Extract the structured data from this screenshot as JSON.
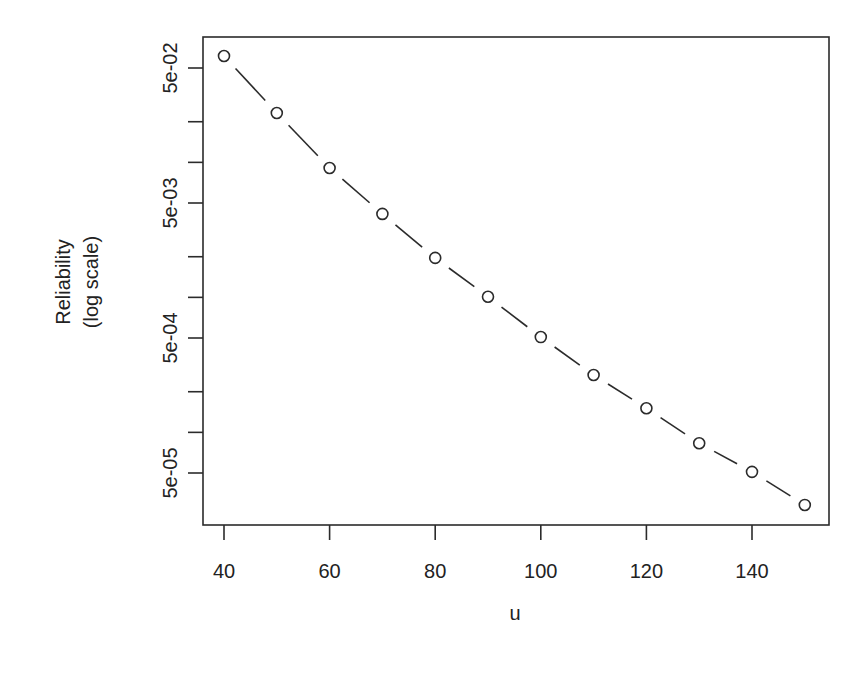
{
  "chart_data": {
    "type": "line",
    "title": "",
    "xlabel": "u",
    "ylabel": "Reliability",
    "ylabel_sub": "(log scale)",
    "yscale": "log",
    "xlim": [
      36,
      154
    ],
    "ylim": [
      2.2e-05,
      0.075
    ],
    "grid": false,
    "legend": null,
    "x_ticks": [
      40,
      60,
      80,
      100,
      120,
      140
    ],
    "x_tick_labels": [
      "40",
      "60",
      "80",
      "100",
      "120",
      "140"
    ],
    "y_ticks": [
      0.05,
      0.02,
      0.01,
      0.005,
      0.002,
      0.001,
      0.0005,
      0.0002,
      0.0001,
      5e-05
    ],
    "y_tick_labels": [
      "5e-02",
      "",
      "",
      "5e-03",
      "",
      "",
      "5e-04",
      "",
      "",
      "5e-05"
    ],
    "series": [
      {
        "name": "reliability",
        "line_style": "dashed",
        "marker": "open-circle",
        "x": [
          40,
          50,
          60,
          70,
          80,
          90,
          100,
          110,
          120,
          130,
          140,
          150
        ],
        "values": [
          0.0614,
          0.0232,
          0.00908,
          0.00415,
          0.00196,
          0.00101,
          0.000508,
          0.000266,
          0.000151,
          8.3e-05,
          5.1e-05,
          2.9e-05
        ]
      }
    ]
  }
}
